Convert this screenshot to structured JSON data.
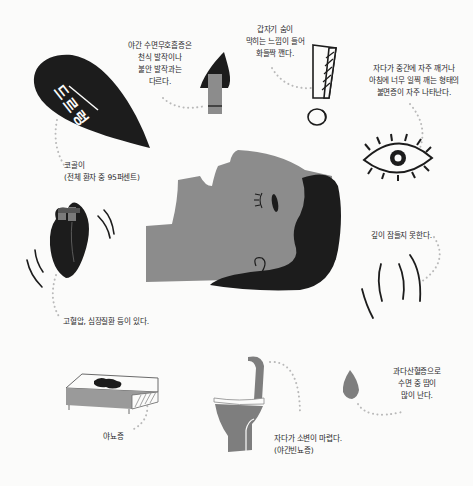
{
  "colors": {
    "background": "#fbfbfa",
    "face_gray": "#8c8c8c",
    "hair_black": "#1c1c1c",
    "ink": "#2a2a2a",
    "dots": "#b9b9b9",
    "bed_gray": "#9a9a9a",
    "toilet_gray": "#7e7e7e"
  },
  "illustrations": {
    "snore_leaf": {
      "icon": "speech-leaf-icon",
      "text": "드르렁"
    },
    "clothespin_nose": {
      "icon": "clothespin-nose-icon"
    },
    "exclamation": {
      "icon": "exclamation-icon"
    },
    "eye": {
      "icon": "open-eye-icon"
    },
    "face": {
      "icon": "sleeping-face-icon"
    },
    "heart": {
      "icon": "heart-icon"
    },
    "restless_lines": {
      "icon": "motion-lines-icon"
    },
    "bed": {
      "icon": "wet-bed-icon"
    },
    "toilet": {
      "icon": "toilet-icon"
    },
    "drop": {
      "icon": "sweat-drop-icon"
    }
  },
  "labels": {
    "snoring": [
      "코골이",
      "(전체 환자 중 95퍼센트)"
    ],
    "apnea_vs_asthma": [
      "야간 수면무호흡증은",
      "천식 발작이나",
      "불안 발작과는",
      "다르다."
    ],
    "sudden_breath": [
      "갑자기 숨이",
      "막히는 느낌이 들어",
      "화들짝 깬다."
    ],
    "insomnia": [
      "자다가 중간에 자주 깨거나",
      "아침에 너무 일찍 깨는 형태의",
      "불면증이 자주 나타난다."
    ],
    "deep_sleep": [
      "깊이 잠들지 못한다."
    ],
    "hypertension": [
      "고혈압, 심장질환 등이 있다."
    ],
    "enuresis": [
      "야뇨증"
    ],
    "nocturia": [
      "자다가 소변이 마렵다.",
      "(야간빈뇨증)"
    ],
    "sweating": [
      "과다산혈증으로",
      "수면 중 땀이",
      "많이 난다."
    ]
  }
}
